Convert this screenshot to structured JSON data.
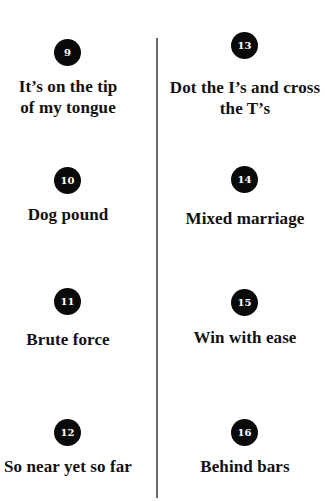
{
  "idioms": [
    {
      "number": "9",
      "label": "It’s on the tip of my tongue",
      "lines": [
        "It’s on the tip",
        "of my tongue"
      ]
    },
    {
      "number": "10",
      "label": "Dog pound",
      "lines": [
        "Dog pound"
      ]
    },
    {
      "number": "11",
      "label": "Brute force",
      "lines": [
        "Brute force"
      ]
    },
    {
      "number": "12",
      "label": "So near yet so far",
      "lines": [
        "So near yet so far"
      ]
    },
    {
      "number": "13",
      "label": "Dot the I’s and cross the T’s",
      "lines": [
        "Dot the I’s and cross",
        "the T’s"
      ]
    },
    {
      "number": "14",
      "label": "Mixed marriage",
      "lines": [
        "Mixed marriage"
      ]
    },
    {
      "number": "15",
      "label": "Win with ease",
      "lines": [
        "Win with ease"
      ]
    },
    {
      "number": "16",
      "label": "Behind bars",
      "lines": [
        "Behind bars"
      ]
    }
  ],
  "colors": {
    "badge_fill": "#0a0a0a",
    "badge_text": "#ffffff",
    "text": "#111111",
    "divider": "#6a6a6a",
    "background": "#ffffff"
  }
}
